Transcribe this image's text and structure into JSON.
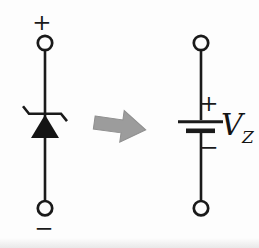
{
  "figure": {
    "background_color": "#fdfdfd",
    "line_color": "#1a1a1a",
    "arrow_color": "#9c9c9c",
    "zener_branch": {
      "component": "zener diode",
      "top_terminal_label": "+",
      "bottom_terminal_label": "−"
    },
    "equivalence_arrow": {
      "direction": "right"
    },
    "source_branch": {
      "component": "dc voltage source",
      "positive_label": "+",
      "negative_label": "−",
      "source_label": "V",
      "source_label_subscript": "Z"
    }
  }
}
